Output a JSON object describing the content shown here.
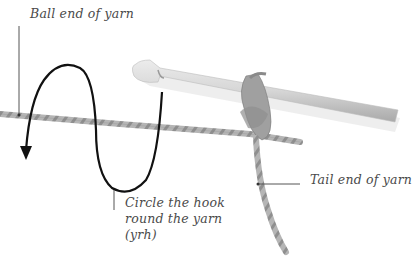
{
  "diagram": {
    "labels": {
      "ball_end": "Ball end of yarn",
      "circle_line1": "Circle the hook",
      "circle_line2": "round the yarn",
      "circle_line3": "(yrh)",
      "tail_end": "Tail end of yarn"
    },
    "colors": {
      "background": "#ffffff",
      "text": "#4a4a4a",
      "leader_line": "#555555",
      "arrow": "#111111",
      "yarn": "#a8a8a8",
      "hook": "#cfcfcf"
    },
    "icons": {
      "hook": "crochet-hook-icon",
      "arrow": "circular-arrow-icon"
    }
  }
}
